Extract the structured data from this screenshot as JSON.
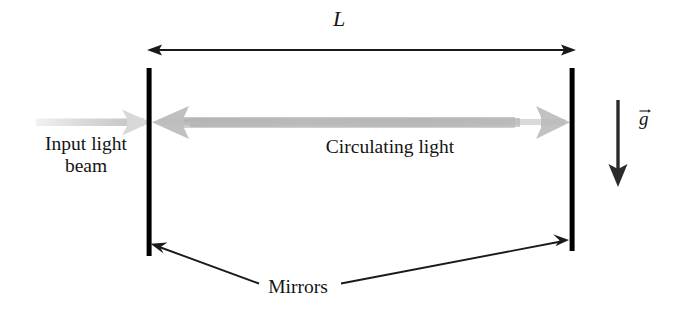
{
  "figure": {
    "background_color": "#ffffff",
    "width": 675,
    "height": 315
  },
  "labels": {
    "cavity_length": "L",
    "input_beam_line1": "Input light",
    "input_beam_line2": "beam",
    "circulating_light": "Circulating light",
    "mirrors": "Mirrors",
    "gravity": "g"
  },
  "colors": {
    "ink": "#141414",
    "mirror": "#000000",
    "beam_gray": "#b4b4b4",
    "beam_faint": "#dcdcdc",
    "dimension_line": "#1a1a1a",
    "leader_line": "#1a1a1a"
  },
  "geometry": {
    "left_mirror": {
      "x": 149,
      "y_top": 68,
      "y_bottom": 256,
      "thickness": 5
    },
    "right_mirror": {
      "x": 572,
      "y_top": 68,
      "y_bottom": 251,
      "thickness": 5
    },
    "length_arrow": {
      "x1": 148,
      "x2": 575,
      "y": 50,
      "double_headed": true
    },
    "gravity_arrow": {
      "x": 618,
      "y_top": 100,
      "y_bottom": 186,
      "direction": "down"
    },
    "circulating_beam": {
      "y_center": 122,
      "x_left": 152,
      "x_right": 571
    },
    "input_beam": {
      "x_start": 36,
      "x_end": 150,
      "y_center": 122
    },
    "mirror_leader_left": {
      "from_x": 262,
      "from_y": 283,
      "to_x": 153,
      "to_y": 245
    },
    "mirror_leader_right": {
      "from_x": 340,
      "from_y": 283,
      "to_x": 568,
      "to_y": 240
    }
  },
  "icon_names": {
    "length_dimension": "double-arrow-icon",
    "gravity": "down-arrow-icon",
    "beam_right": "right-arrow-icon",
    "beam_left": "left-arrow-icon",
    "vector_hat": "vector-arrow-icon"
  }
}
